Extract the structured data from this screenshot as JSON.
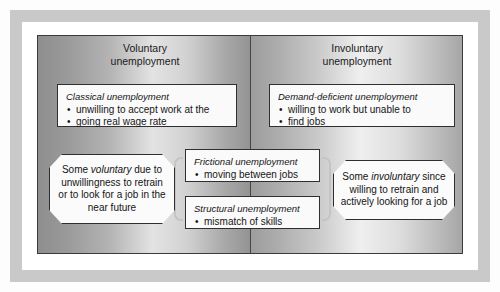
{
  "figure": {
    "columns": [
      {
        "id": "voluntary",
        "header_line1": "Voluntary",
        "header_line2": "unemployment"
      },
      {
        "id": "involuntary",
        "header_line1": "Involuntary",
        "header_line2": "unemployment"
      }
    ],
    "boxes": [
      {
        "id": "classical",
        "title": "Classical unemployment",
        "bullet1": "unwilling to accept work at the",
        "bullet2": "going real wage rate"
      },
      {
        "id": "demand-deficient",
        "title": "Demand-deficient unemployment",
        "bullet1": "willing to work but unable to",
        "bullet2": "find jobs"
      },
      {
        "id": "frictional",
        "title": "Frictional unemployment",
        "bullet1": "moving between jobs"
      },
      {
        "id": "structural",
        "title": "Structural unemployment",
        "bullet1": "mismatch of skills"
      }
    ],
    "callouts": [
      {
        "id": "voluntary-callout",
        "text_before": "Some ",
        "emphasis": "voluntary",
        "text_after": " due to unwillingness to retrain or to look for a job in the near future"
      },
      {
        "id": "involuntary-callout",
        "text_before": "Some ",
        "emphasis": "involuntary",
        "text_after": " since willing to retrain and actively looking for a job"
      }
    ],
    "colors": {
      "frame_band": "#c9c9c9",
      "panel_border": "#3b3b3b",
      "box_border": "#2f2f2f",
      "box_fill": "#fafafa",
      "bracket": "#c4c4c4",
      "text": "#141414"
    }
  }
}
